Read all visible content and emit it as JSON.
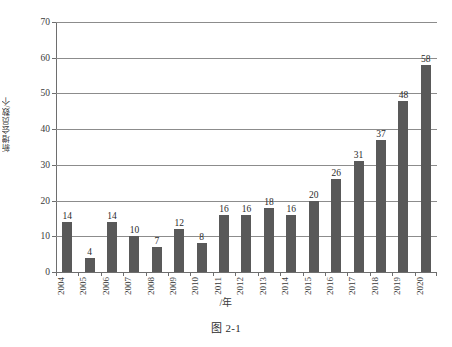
{
  "figure": {
    "caption": "图 2-1"
  },
  "chart_data": {
    "type": "bar",
    "title": "",
    "subtitle": "",
    "xlabel": "/年",
    "ylabel": "新增会员数/个",
    "categories": [
      "2004",
      "2005",
      "2006",
      "2007",
      "2008",
      "2009",
      "2010",
      "2011",
      "2012",
      "2013",
      "2014",
      "2015",
      "2016",
      "2017",
      "2018",
      "2019",
      "2020"
    ],
    "values": [
      14,
      4,
      14,
      10,
      7,
      12,
      8,
      16,
      16,
      18,
      16,
      20,
      26,
      31,
      37,
      48,
      58
    ],
    "data_labels": [
      "14",
      "4",
      "14",
      "10",
      "7",
      "12",
      "8",
      "16",
      "16",
      "18",
      "16",
      "20",
      "26",
      "31",
      "37",
      "48",
      "58"
    ],
    "ylim": [
      0,
      70
    ],
    "ytick_values": [
      0,
      10,
      20,
      30,
      40,
      50,
      60,
      70
    ],
    "ytick_labels": [
      "0",
      "10",
      "20",
      "30",
      "40",
      "50",
      "60",
      "70"
    ],
    "grid": true,
    "grid_axis": "y",
    "legend": null,
    "legend_position": "none",
    "bar_color": "#595959",
    "gridline_color": "#8c8c8c",
    "axis_color": "#6e6e6e",
    "background_color": "#ffffff",
    "text_color": "#2b2b2b"
  }
}
